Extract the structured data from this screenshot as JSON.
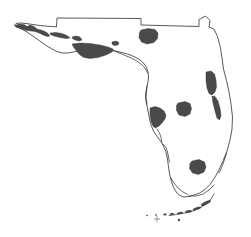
{
  "figure": {
    "background_color": "#ffffff",
    "outline_color": "#3c3c3c",
    "water_fill_color": "#4a4a4a",
    "land_fill_color": "#ffffff",
    "width": 251,
    "height": 237
  },
  "map": {
    "region_label": "Florida",
    "state_outline_name": "florida-state-boundary",
    "outline_path": "M 56.5 26.5 L 57.0 18.0 L 141.0 18.5 L 141.0 25.0 L 199.0 26.5 L 199.0 19.5 L 205.5 16.0 L 210.0 20.5 L 209.0 27.0 L 214.0 29.0 L 217.5 36.5 L 220.5 48.0 L 222.0 58.0 L 223.5 69.0 L 226.5 80.5 L 229.0 92.0 L 231.0 104.0 L 232.5 117.0 L 232.0 129.0 L 230.0 140.0 L 227.0 151.0 L 223.0 161.0 L 219.0 170.0 L 214.5 178.0 L 210.0 184.5 L 205.0 189.5 L 199.5 193.0 L 194.0 195.0 L 189.0 196.5 L 184.0 197.0 L 180.0 195.5 L 177.0 193.0 L 175.0 190.0 L 173.0 186.0 L 171.0 180.0 L 169.5 174.0 L 168.5 167.0 L 167.5 159.0 L 166.0 152.0 L 163.5 146.0 L 160.5 141.0 L 157.5 137.0 L 155.0 133.5 L 153.0 130.0 L 151.5 126.0 L 150.0 121.0 L 149.0 116.0 L 148.0 111.0 L 147.0 106.0 L 146.0 101.0 L 145.5 96.0 L 146.0 91.0 L 147.0 86.5 L 148.0 82.0 L 148.5 77.0 L 148.0 72.0 L 146.5 67.5 L 144.0 63.5 L 140.0 60.0 L 135.0 57.0 L 129.0 54.5 L 122.0 52.5 L 115.0 51.0 L 108.0 50.0 L 101.0 49.5 L 94.0 49.5 L 87.0 50.0 L 80.0 51.0 L 73.5 52.0 L 67.5 53.0 L 62.0 53.0 L 57.0 51.5 L 52.0 49.0 L 47.0 46.0 L 42.0 42.5 L 37.0 39.0 L 32.0 35.5 L 27.0 32.0 L 22.5 29.5 L 18.5 27.5 L 15.5 26.5 L 14.5 25.0 L 16.0 23.5 L 20.0 23.0 L 26.0 23.5 L 33.0 24.5 L 40.0 25.5 L 47.0 26.2 L 52.5 26.5 Z",
    "water_bodies": [
      {
        "name": "pensacola-bay-complex",
        "label": "Pensacola Bay",
        "path": "M 15.0 25.5 L 19.0 24.0 L 24.0 24.5 L 27.0 26.5 L 30.0 25.0 L 34.0 26.5 L 37.0 29.0 L 41.0 30.0 L 45.0 31.5 L 48.0 33.5 L 50.0 36.0 L 47.0 36.5 L 43.0 35.0 L 39.0 33.0 L 35.0 31.5 L 31.0 31.0 L 27.0 30.5 L 23.0 29.5 L 19.0 28.0 L 16.0 27.0 Z"
      },
      {
        "name": "choctawhatchee-bay",
        "label": "Choctawhatchee Bay",
        "path": "M 50.0 33.0 L 56.0 32.5 L 62.0 33.5 L 67.0 35.5 L 70.0 38.0 L 66.0 38.5 L 60.0 37.5 L 54.0 36.0 L 50.5 34.5 Z"
      },
      {
        "name": "saint-andrews-bay",
        "label": "St. Andrews Bay",
        "path": "M 72.0 37.0 L 76.0 36.0 L 80.0 37.0 L 82.0 40.0 L 79.0 41.0 L 75.0 40.0 L 72.5 38.5 Z"
      },
      {
        "name": "apalachicola-bay",
        "label": "Apalachicola Bay",
        "path": "M 72.0 44.0 L 80.0 43.0 L 90.0 43.5 L 100.0 45.0 L 108.0 47.0 L 113.0 49.0 L 112.0 52.0 L 106.0 55.0 L 98.0 57.5 L 90.0 58.5 L 84.0 57.5 L 80.0 55.0 L 76.5 51.0 L 73.5 47.0 Z"
      },
      {
        "name": "saint-marks-inlet",
        "label": "St. Marks",
        "path": "M 112.0 42.0 L 116.0 41.0 L 119.0 42.5 L 118.0 45.0 L 114.0 45.5 L 112.0 44.0 Z"
      },
      {
        "name": "osceola-lake-north",
        "label": "North Florida lake",
        "path": "M 141.0 30.0 L 148.0 28.5 L 155.0 29.5 L 158.0 33.0 L 157.5 38.5 L 154.0 42.5 L 147.0 44.0 L 141.5 42.0 L 139.0 37.5 L 139.5 32.5 Z"
      },
      {
        "name": "indian-river-lagoon",
        "label": "Indian River Lagoon",
        "path": "M 206.0 72.0 L 211.0 71.0 L 214.5 74.0 L 216.0 80.0 L 216.5 87.0 L 215.0 92.0 L 212.0 95.0 L 209.0 93.5 L 207.0 88.0 L 206.0 81.0 Z"
      },
      {
        "name": "indian-river-south-strip",
        "label": "Indian River (south)",
        "path": "M 212.0 96.0 L 215.0 96.5 L 218.0 101.0 L 220.0 108.0 L 221.0 116.0 L 219.5 120.0 L 217.0 118.0 L 215.0 111.0 L 213.0 103.0 Z"
      },
      {
        "name": "tampa-bay",
        "label": "Tampa Bay",
        "path": "M 150.0 108.0 L 155.0 106.5 L 160.0 108.0 L 164.0 111.0 L 166.0 115.0 L 165.0 119.0 L 162.0 123.0 L 158.5 126.5 L 155.0 128.0 L 152.5 125.5 L 151.0 121.0 L 150.0 115.0 Z"
      },
      {
        "name": "lake-kissimmee",
        "label": "Central Florida lake",
        "path": "M 178.0 103.0 L 185.0 101.5 L 190.0 103.5 L 191.5 108.5 L 190.0 114.0 L 185.0 116.5 L 179.0 115.0 L 176.5 110.5 L 176.5 105.5 Z"
      },
      {
        "name": "lake-okeechobee",
        "label": "Lake Okeechobee",
        "path": "M 192.0 161.0 L 199.0 159.5 L 204.5 162.0 L 206.0 167.0 L 204.0 172.0 L 198.5 174.5 L 192.5 173.0 L 189.5 168.5 L 190.0 163.5 Z"
      }
    ],
    "coast_details": [
      {
        "name": "big-bend-coastline",
        "path": "M 113.0 50.0 L 118.0 52.5 L 124.0 55.0 L 130.0 57.5 L 136.0 60.5 L 141.0 64.0 L 145.0 68.0 L 147.5 73.0"
      },
      {
        "name": "nature-coast-detail",
        "path": "M 147.0 86.0 L 146.5 92.0 L 146.0 98.0 L 147.0 104.0"
      },
      {
        "name": "sarasota-barrier-islands",
        "path": "M 157.0 129.0 L 159.5 133.0 L 161.0 137.5 L 162.0 142.0"
      },
      {
        "name": "charlotte-harbor",
        "path": "M 163.0 144.0 L 166.0 147.5 L 167.5 152.0 L 168.5 157.0 L 169.5 162.0"
      },
      {
        "name": "ten-thousand-islands",
        "path": "M 171.0 178.0 L 174.0 183.0 L 178.0 188.0 L 183.0 192.0 L 188.0 194.5"
      },
      {
        "name": "florida-bay-coast",
        "path": "M 189.0 196.0 L 196.0 196.0 L 203.0 194.0 L 209.0 190.0 L 214.0 185.0"
      },
      {
        "name": "biscayne-bay-coast",
        "path": "M 219.0 173.0 L 221.5 168.0 L 224.0 161.0 L 226.5 153.0"
      }
    ],
    "keys_islands": [
      {
        "name": "key-largo",
        "cx": 206.0,
        "cy": 203.0,
        "rx": 5.5,
        "ry": 1.6,
        "rotate": -26
      },
      {
        "name": "upper-keys",
        "cx": 197.0,
        "cy": 208.5,
        "rx": 4.5,
        "ry": 1.4,
        "rotate": -18
      },
      {
        "name": "middle-keys",
        "cx": 188.5,
        "cy": 211.5,
        "rx": 3.5,
        "ry": 1.2,
        "rotate": -10
      },
      {
        "name": "lower-keys",
        "cx": 180.0,
        "cy": 213.0,
        "rx": 3.0,
        "ry": 1.1,
        "rotate": -6
      },
      {
        "name": "big-pine-key",
        "cx": 172.0,
        "cy": 214.0,
        "rx": 2.4,
        "ry": 1.0,
        "rotate": -4
      },
      {
        "name": "key-west",
        "cx": 165.0,
        "cy": 214.5,
        "rx": 1.8,
        "ry": 0.9,
        "rotate": 0
      },
      {
        "name": "marquesas-keys",
        "cx": 156.0,
        "cy": 215.0,
        "rx": 1.1,
        "ry": 0.8,
        "rotate": 0
      },
      {
        "name": "dry-tortugas",
        "cx": 147.0,
        "cy": 215.5,
        "rx": 0.9,
        "ry": 0.7,
        "rotate": 0
      }
    ],
    "keys_arc": {
      "name": "florida-keys-arc",
      "path": "M 214.0 194.0 L 211.0 199.0 L 206.0 204.0 L 200.0 208.0 L 193.0 211.0 L 185.0 213.0 L 177.0 214.5 L 169.0 215.5"
    },
    "reference_marks": [
      {
        "name": "reference-crosshair",
        "x": 157.0,
        "y": 219.0,
        "size": 3.0
      },
      {
        "name": "reference-dot",
        "x": 179.0,
        "y": 220.0,
        "size": 1.2
      }
    ]
  }
}
